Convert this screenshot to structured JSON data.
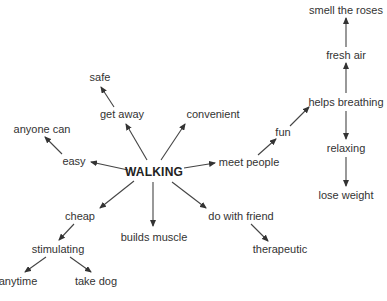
{
  "diagram": {
    "type": "mind-map",
    "center": {
      "id": "walking",
      "label": "WALKING",
      "x": 154,
      "y": 172
    },
    "nodes": [
      {
        "id": "safe",
        "label": "safe",
        "x": 100,
        "y": 77
      },
      {
        "id": "get_away",
        "label": "get away",
        "x": 122,
        "y": 114
      },
      {
        "id": "convenient",
        "label": "convenient",
        "x": 213,
        "y": 114
      },
      {
        "id": "anyone_can",
        "label": "anyone can",
        "x": 42,
        "y": 129
      },
      {
        "id": "easy",
        "label": "easy",
        "x": 74,
        "y": 161
      },
      {
        "id": "meet_people",
        "label": "meet people",
        "x": 249,
        "y": 162
      },
      {
        "id": "fun",
        "label": "fun",
        "x": 283,
        "y": 132
      },
      {
        "id": "smell_the_roses",
        "label": "smell the roses",
        "x": 346,
        "y": 10
      },
      {
        "id": "fresh_air",
        "label": "fresh air",
        "x": 346,
        "y": 55
      },
      {
        "id": "helps_breathing",
        "label": "helps breathing",
        "x": 346,
        "y": 102
      },
      {
        "id": "relaxing",
        "label": "relaxing",
        "x": 346,
        "y": 148
      },
      {
        "id": "lose_weight",
        "label": "lose weight",
        "x": 346,
        "y": 195
      },
      {
        "id": "cheap",
        "label": "cheap",
        "x": 80,
        "y": 216
      },
      {
        "id": "builds_muscle",
        "label": "builds muscle",
        "x": 154,
        "y": 237
      },
      {
        "id": "do_with_friend",
        "label": "do with friend",
        "x": 241,
        "y": 216
      },
      {
        "id": "therapeutic",
        "label": "therapeutic",
        "x": 280,
        "y": 249
      },
      {
        "id": "stimulating",
        "label": "stimulating",
        "x": 58,
        "y": 249
      },
      {
        "id": "anytime",
        "label": "anytime",
        "x": 18,
        "y": 281
      },
      {
        "id": "take_dog",
        "label": "take dog",
        "x": 96,
        "y": 281
      }
    ],
    "edges": [
      {
        "x1": 147,
        "y1": 160,
        "x2": 126,
        "y2": 124
      },
      {
        "x1": 161,
        "y1": 160,
        "x2": 185,
        "y2": 124
      },
      {
        "x1": 114,
        "y1": 107,
        "x2": 101,
        "y2": 87
      },
      {
        "x1": 128,
        "y1": 170,
        "x2": 91,
        "y2": 162
      },
      {
        "x1": 62,
        "y1": 154,
        "x2": 45,
        "y2": 137
      },
      {
        "x1": 184,
        "y1": 168,
        "x2": 215,
        "y2": 163
      },
      {
        "x1": 258,
        "y1": 155,
        "x2": 276,
        "y2": 139
      },
      {
        "x1": 290,
        "y1": 126,
        "x2": 309,
        "y2": 107
      },
      {
        "x1": 346,
        "y1": 93,
        "x2": 346,
        "y2": 63
      },
      {
        "x1": 346,
        "y1": 47,
        "x2": 346,
        "y2": 18
      },
      {
        "x1": 346,
        "y1": 111,
        "x2": 346,
        "y2": 139
      },
      {
        "x1": 346,
        "y1": 157,
        "x2": 346,
        "y2": 186
      },
      {
        "x1": 134,
        "y1": 181,
        "x2": 100,
        "y2": 208
      },
      {
        "x1": 153,
        "y1": 182,
        "x2": 153,
        "y2": 226
      },
      {
        "x1": 172,
        "y1": 182,
        "x2": 206,
        "y2": 208
      },
      {
        "x1": 251,
        "y1": 224,
        "x2": 268,
        "y2": 241
      },
      {
        "x1": 74,
        "y1": 224,
        "x2": 59,
        "y2": 240
      },
      {
        "x1": 46,
        "y1": 257,
        "x2": 25,
        "y2": 272
      },
      {
        "x1": 70,
        "y1": 257,
        "x2": 91,
        "y2": 272
      }
    ]
  }
}
